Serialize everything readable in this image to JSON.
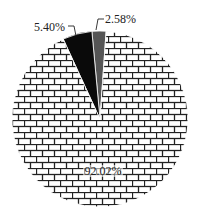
{
  "chart_data": {
    "type": "pie",
    "title": "",
    "slices": [
      {
        "label": "92.02%",
        "value": 92.02,
        "fill": "brick-pattern",
        "color": "#ffffff"
      },
      {
        "label": "5.40%",
        "value": 5.4,
        "fill": "solid",
        "color": "#0a0a0a"
      },
      {
        "label": "2.58%",
        "value": 2.58,
        "fill": "solid",
        "color": "#555555"
      }
    ],
    "legend": "none",
    "labels_shown": [
      "5.40%",
      "2.58%",
      "92.02%"
    ]
  }
}
